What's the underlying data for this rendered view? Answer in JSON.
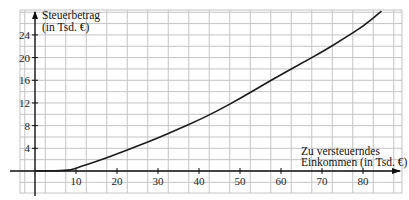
{
  "chart_data": {
    "type": "line",
    "title": "",
    "xlabel": "Zu versteuerndes Einkommen (in Tsd. €)",
    "ylabel": "Steuerbetrag (in Tsd. €)",
    "xlabel_lines": [
      "Zu versteuerndes",
      "Einkommen (in Tsd. €)"
    ],
    "ylabel_lines": [
      "Steuerbetrag",
      "(in Tsd. €)"
    ],
    "xlim": [
      -6,
      90
    ],
    "ylim": [
      -4,
      28
    ],
    "x_ticks": [
      10,
      20,
      30,
      40,
      50,
      60,
      70,
      80
    ],
    "y_ticks": [
      4,
      8,
      12,
      16,
      20,
      24
    ],
    "grid": true,
    "grid_step_x": 5,
    "grid_step_y": 2,
    "legend": null,
    "series": [
      {
        "name": "Steuerbetrag",
        "x": [
          0,
          8,
          10,
          15,
          20,
          25,
          30,
          35,
          40,
          45,
          50,
          55,
          60,
          65,
          70,
          75,
          80,
          84.5
        ],
        "values": [
          0,
          0,
          0.5,
          1.7,
          3.0,
          4.4,
          5.8,
          7.4,
          9.0,
          10.8,
          12.8,
          14.9,
          17.0,
          19.0,
          21.0,
          23.2,
          25.5,
          28.2
        ]
      }
    ]
  }
}
